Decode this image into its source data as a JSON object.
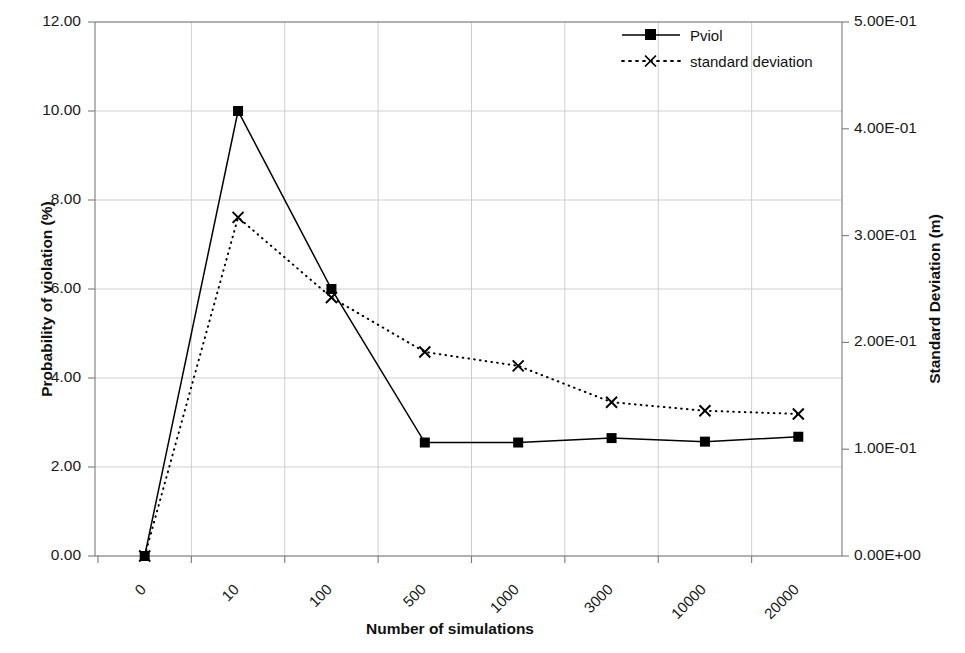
{
  "chart_data": {
    "type": "line",
    "title": "",
    "xlabel": "Number of simulations",
    "ylabel": "Probability of violation (%)",
    "y2label": "Standard Deviation (m)",
    "categories": [
      "0",
      "10",
      "100",
      "500",
      "1000",
      "3000",
      "10000",
      "20000"
    ],
    "xtick_rotation": -45,
    "grid": true,
    "legend_position": "top-right",
    "ylim": [
      0,
      12
    ],
    "yticks": [
      0,
      2,
      4,
      6,
      8,
      10,
      12
    ],
    "ytick_labels": [
      "0.00",
      "2.00",
      "4.00",
      "6.00",
      "8.00",
      "10.00",
      "12.00"
    ],
    "y2lim": [
      0,
      0.5
    ],
    "y2ticks": [
      0,
      0.1,
      0.2,
      0.3,
      0.4,
      0.5
    ],
    "y2tick_labels": [
      "0.00E+00",
      "1.00E-01",
      "2.00E-01",
      "3.00E-01",
      "4.00E-01",
      "5.00E-01"
    ],
    "series": [
      {
        "name": "Pviol",
        "axis": "left",
        "marker": "square",
        "linestyle": "solid",
        "color": "#000000",
        "values": [
          0.0,
          10.0,
          6.0,
          2.55,
          2.55,
          2.65,
          2.57,
          2.68
        ]
      },
      {
        "name": "standard deviation",
        "axis": "right",
        "marker": "x",
        "linestyle": "dotted",
        "color": "#000000",
        "values": [
          0.0,
          0.317,
          0.242,
          0.191,
          0.178,
          0.144,
          0.136,
          0.133
        ]
      }
    ]
  },
  "legend": {
    "entries": [
      {
        "label": "Pviol"
      },
      {
        "label": "standard deviation"
      }
    ]
  },
  "axes": {
    "left_title": "Probability of violation (%)",
    "right_title": "Standard Deviation (m)",
    "bottom_title": "Number of simulations"
  },
  "colors": {
    "line": "#000000",
    "grid": "#c9c9c9",
    "axis": "#7a7a7a",
    "text": "#111111"
  }
}
